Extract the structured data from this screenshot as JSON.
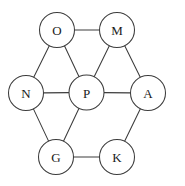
{
  "figure": {
    "width": 185,
    "height": 186,
    "background_color": "#ffffff",
    "stroke_color": "#3c3c3c",
    "label_color": "#1a1a1a",
    "node_fill": "#ffffff",
    "node_radius": 17.5
  },
  "chart_data": {
    "type": "diagram",
    "title": "",
    "nodes": [
      {
        "id": "O",
        "label": "O",
        "x": 57,
        "y": 30
      },
      {
        "id": "M",
        "label": "M",
        "x": 117,
        "y": 30
      },
      {
        "id": "N",
        "label": "N",
        "x": 26,
        "y": 93
      },
      {
        "id": "P",
        "label": "P",
        "x": 86.5,
        "y": 92.5
      },
      {
        "id": "A",
        "label": "A",
        "x": 148,
        "y": 93
      },
      {
        "id": "G",
        "label": "G",
        "x": 56,
        "y": 157
      },
      {
        "id": "K",
        "label": "K",
        "x": 117,
        "y": 157
      }
    ],
    "edges": [
      {
        "from": "O",
        "to": "M"
      },
      {
        "from": "O",
        "to": "N"
      },
      {
        "from": "O",
        "to": "P"
      },
      {
        "from": "M",
        "to": "P"
      },
      {
        "from": "M",
        "to": "A"
      },
      {
        "from": "N",
        "to": "P"
      },
      {
        "from": "N",
        "to": "G"
      },
      {
        "from": "P",
        "to": "G"
      },
      {
        "from": "P",
        "to": "A"
      },
      {
        "from": "A",
        "to": "K"
      },
      {
        "from": "G",
        "to": "K"
      }
    ]
  }
}
